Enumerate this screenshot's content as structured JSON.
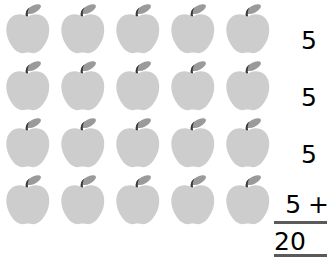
{
  "worksheet": {
    "type": "repeated-addition-array",
    "object_icon": "apple-icon",
    "rows": 4,
    "columns": 5,
    "background_color": "#ffffff"
  },
  "apple": {
    "body_color": "#cdcdcd",
    "stem_color": "#3a3a3a",
    "leaf_color": "#9a9a9a"
  },
  "grid": {
    "rows": [
      {
        "label": "apple-row-1",
        "count": 5
      },
      {
        "label": "apple-row-2",
        "count": 5
      },
      {
        "label": "apple-row-3",
        "count": 5
      },
      {
        "label": "apple-row-4",
        "count": 5
      }
    ]
  },
  "sum": {
    "addends": [
      {
        "value": "5",
        "operator": ""
      },
      {
        "value": "5",
        "operator": ""
      },
      {
        "value": "5",
        "operator": ""
      },
      {
        "value": "5",
        "operator": "+"
      }
    ],
    "total": "20",
    "rule_color": "#5a5a5a"
  }
}
